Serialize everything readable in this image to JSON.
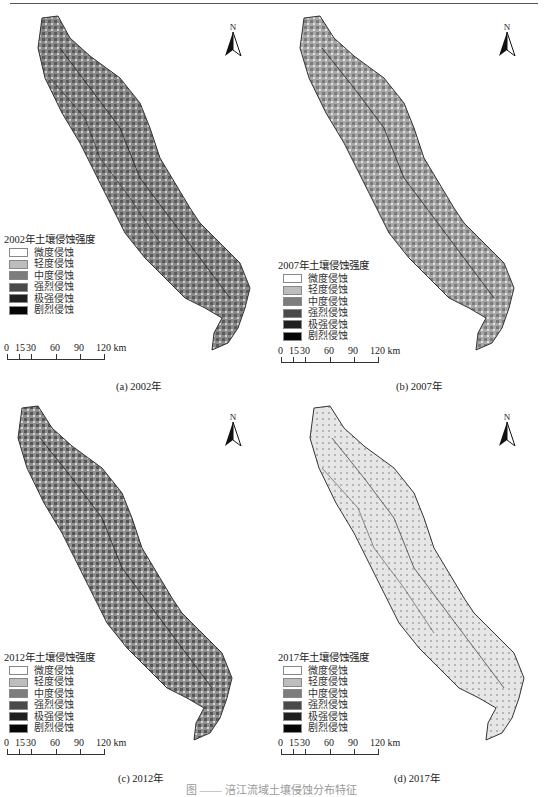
{
  "panels": [
    {
      "legend_title": "2002年土壤侵蚀强度",
      "caption": "(a) 2002年",
      "north": "N",
      "shade": "dark"
    },
    {
      "legend_title": "2007年土壤侵蚀强度",
      "caption": "(b) 2007年",
      "north": "N",
      "shade": "medium"
    },
    {
      "legend_title": "2012年土壤侵蚀强度",
      "caption": "(c) 2012年",
      "north": "N",
      "shade": "dark"
    },
    {
      "legend_title": "2017年土壤侵蚀强度",
      "caption": "(d) 2017年",
      "north": "N",
      "shade": "light"
    }
  ],
  "legend_classes": [
    {
      "label": "微度侵蚀",
      "color": "#ffffff"
    },
    {
      "label": "轻度侵蚀",
      "color": "#bdbdbd"
    },
    {
      "label": "中度侵蚀",
      "color": "#7d7d7d"
    },
    {
      "label": "强烈侵蚀",
      "color": "#4a4a4a"
    },
    {
      "label": "极强侵蚀",
      "color": "#1f1f1f"
    },
    {
      "label": "剧烈侵蚀",
      "color": "#050505"
    }
  ],
  "scale_bar": {
    "ticks": [
      "0",
      "15",
      "30",
      "60",
      "90",
      "120 km"
    ]
  },
  "map_labels_2017": [
    "平武县",
    "北川县",
    "江油市",
    "茂县",
    "安州区",
    "绵竹市",
    "梓潼县",
    "盐亭县",
    "三台县",
    "射洪市",
    "蓬溪县",
    "大英县",
    "遂宁市船山区",
    "安居区",
    "潼南区",
    "合川区"
  ],
  "figure_caption": "图 —— 涪江流域土壤侵蚀分布特征"
}
